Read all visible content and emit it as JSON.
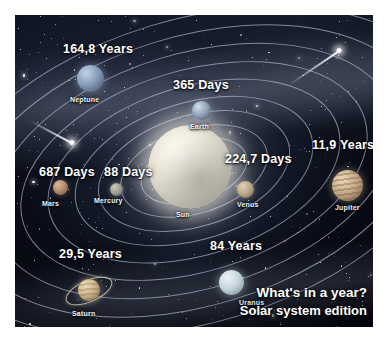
{
  "poster": {
    "title_line1": "What's in a year?",
    "title_line2": "Solar system edition",
    "background": "#05070e",
    "orbit_color": "#cdd6e8",
    "text_color": "#ffffff"
  },
  "sun": {
    "name": "Sun"
  },
  "planets": [
    {
      "name": "Mercury",
      "period": "88 Days",
      "color": "#9a968c"
    },
    {
      "name": "Venus",
      "period": "224,7 Days",
      "color": "#b6a384"
    },
    {
      "name": "Earth",
      "period": "365 Days",
      "color": "#8ea2b8"
    },
    {
      "name": "Mars",
      "period": "687 Days",
      "color": "#b08a6a"
    },
    {
      "name": "Jupiter",
      "period": "11,9 Years",
      "color": "#c4a785"
    },
    {
      "name": "Saturn",
      "period": "29,5 Years",
      "color": "#c9b089"
    },
    {
      "name": "Uranus",
      "period": "84 Years",
      "color": "#c2d2da"
    },
    {
      "name": "Neptune",
      "period": "164,8 Years",
      "color": "#7f96b4"
    }
  ]
}
